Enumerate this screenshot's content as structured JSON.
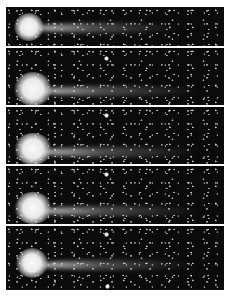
{
  "image": {
    "description": "Sequence of five photographic frames of a comet with coma and tail against a star field",
    "frames": [
      {
        "index": 1,
        "top": 7,
        "height": 39,
        "head_x": 30,
        "head_y": 27,
        "head_size": 26,
        "tail_len": 150
      },
      {
        "index": 2,
        "top": 48,
        "height": 57,
        "head_x": 30,
        "head_y": 90,
        "head_size": 34,
        "tail_len": 165
      },
      {
        "index": 3,
        "top": 107,
        "height": 57,
        "head_x": 30,
        "head_y": 150,
        "head_size": 34,
        "tail_len": 165
      },
      {
        "index": 4,
        "top": 166,
        "height": 58,
        "head_x": 30,
        "head_y": 210,
        "head_size": 34,
        "tail_len": 165
      },
      {
        "index": 5,
        "top": 226,
        "height": 64,
        "head_x": 32,
        "head_y": 263,
        "head_size": 28,
        "tail_len": 160
      }
    ],
    "colors": {
      "sky": "#0b0b0b",
      "separator": "#ffffff",
      "coma": "#f2f2f2"
    }
  }
}
